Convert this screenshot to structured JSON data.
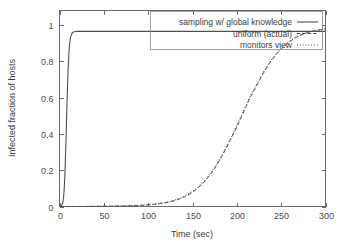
{
  "chart_data": {
    "type": "line",
    "title": "",
    "xlabel": "Time (sec)",
    "ylabel": "Infected fraction of hosts",
    "xlim": [
      0,
      300
    ],
    "ylim": [
      0,
      1.08
    ],
    "xticks": [
      0,
      50,
      100,
      150,
      200,
      250,
      300
    ],
    "xtick_labels": [
      "0",
      "50",
      "100",
      "150",
      "200",
      "250",
      "300"
    ],
    "yticks": [
      0,
      0.2,
      0.4,
      0.6,
      0.8,
      1
    ],
    "ytick_labels": [
      "0",
      "0.2",
      "0.4",
      "0.6",
      "0.8",
      "1"
    ],
    "grid": false,
    "legend_position": "top-right",
    "series": [
      {
        "name": "sampling w/ global knowledge",
        "style": "solid",
        "color": "#4f4f4f",
        "x": [
          0,
          1,
          2,
          3,
          4,
          5,
          6,
          7,
          8,
          9,
          10,
          11,
          12,
          13,
          14,
          15,
          16,
          18,
          20,
          25,
          30,
          40,
          50,
          75,
          100,
          125,
          150,
          175,
          200,
          225,
          250,
          265,
          275,
          285,
          300
        ],
        "y": [
          0.0,
          0.002,
          0.005,
          0.012,
          0.03,
          0.075,
          0.165,
          0.31,
          0.49,
          0.66,
          0.79,
          0.873,
          0.918,
          0.942,
          0.954,
          0.96,
          0.962,
          0.964,
          0.965,
          0.965,
          0.965,
          0.965,
          0.965,
          0.965,
          0.965,
          0.965,
          0.965,
          0.965,
          0.965,
          0.965,
          0.965,
          0.965,
          0.965,
          0.965,
          0.965
        ]
      },
      {
        "name": "uniform (actual)",
        "style": "dashed",
        "color": "#4f4f4f",
        "x": [
          0,
          20,
          40,
          60,
          80,
          90,
          100,
          110,
          120,
          130,
          140,
          150,
          160,
          170,
          180,
          190,
          200,
          210,
          215,
          220,
          230,
          240,
          250,
          260,
          270,
          280,
          290,
          300
        ],
        "y": [
          0.0,
          0.0,
          0.001,
          0.002,
          0.004,
          0.006,
          0.009,
          0.014,
          0.021,
          0.033,
          0.051,
          0.079,
          0.119,
          0.176,
          0.25,
          0.34,
          0.44,
          0.545,
          0.6,
          0.645,
          0.735,
          0.81,
          0.868,
          0.91,
          0.94,
          0.958,
          0.97,
          0.978
        ]
      },
      {
        "name": "monitors view",
        "style": "dotted",
        "color": "#4f4f4f",
        "x": [
          0,
          20,
          40,
          60,
          80,
          90,
          100,
          110,
          120,
          130,
          140,
          150,
          160,
          170,
          180,
          190,
          200,
          210,
          215,
          220,
          230,
          240,
          250,
          260,
          270,
          280,
          290,
          300
        ],
        "y": [
          0.0,
          0.0,
          0.001,
          0.002,
          0.005,
          0.007,
          0.01,
          0.016,
          0.024,
          0.036,
          0.055,
          0.084,
          0.125,
          0.182,
          0.258,
          0.348,
          0.449,
          0.553,
          0.607,
          0.652,
          0.741,
          0.815,
          0.872,
          0.913,
          0.942,
          0.96,
          0.972,
          0.98
        ]
      }
    ]
  }
}
